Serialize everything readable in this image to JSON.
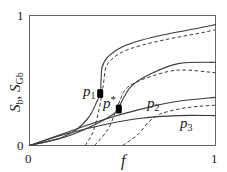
{
  "chart_data": {
    "type": "line",
    "title": "",
    "xlabel": "f",
    "ylabel": "S_b, S_Gb",
    "xlim": [
      0,
      1
    ],
    "ylim": [
      0,
      1
    ],
    "x_ticks": [
      "0",
      "1"
    ],
    "y_ticks": [
      "0",
      "1"
    ],
    "grid": false,
    "legend": "inline curve labels",
    "series": [
      {
        "name": "p1 (S_b, solid)",
        "label": "p1",
        "style": "solid",
        "x": [
          0,
          0.15,
          0.25,
          0.32,
          0.36,
          0.38,
          0.385,
          0.39,
          0.42,
          0.5,
          0.6,
          0.75,
          0.9,
          1.0
        ],
        "y": [
          0,
          0.05,
          0.12,
          0.22,
          0.33,
          0.4,
          0.5,
          0.6,
          0.68,
          0.76,
          0.81,
          0.86,
          0.9,
          0.93
        ]
      },
      {
        "name": "p1 (S_Gb, dashed)",
        "label": "p1",
        "style": "dashed",
        "x": [
          0.3,
          0.34,
          0.37,
          0.39,
          0.4,
          0.41,
          0.44,
          0.5,
          0.6,
          0.75,
          0.9,
          1.0
        ],
        "y": [
          0,
          0.1,
          0.25,
          0.4,
          0.5,
          0.6,
          0.66,
          0.72,
          0.77,
          0.82,
          0.86,
          0.89
        ]
      },
      {
        "name": "p* (S_b, solid)",
        "label": "p*",
        "style": "solid",
        "x": [
          0,
          0.2,
          0.35,
          0.45,
          0.48,
          0.5,
          0.55,
          0.65,
          0.8,
          1.0
        ],
        "y": [
          0,
          0.07,
          0.16,
          0.24,
          0.29,
          0.35,
          0.46,
          0.55,
          0.63,
          0.64
        ]
      },
      {
        "name": "p* (S_Gb, dashed)",
        "label": "p*",
        "style": "dashed",
        "x": [
          0.35,
          0.42,
          0.46,
          0.49,
          0.51,
          0.55,
          0.65,
          0.8,
          1.0
        ],
        "y": [
          0,
          0.12,
          0.25,
          0.36,
          0.42,
          0.47,
          0.53,
          0.58,
          0.56
        ]
      },
      {
        "name": "p2 (S_b, solid)",
        "label": "p2",
        "style": "solid",
        "x": [
          0,
          0.2,
          0.4,
          0.6,
          0.8,
          1.0
        ],
        "y": [
          0,
          0.1,
          0.2,
          0.28,
          0.34,
          0.37
        ]
      },
      {
        "name": "p2 (S_Gb, dashed)",
        "label": "p2",
        "style": "dashed",
        "x": [
          0.5,
          0.58,
          0.64,
          0.7,
          0.8,
          0.9,
          1.0
        ],
        "y": [
          0,
          0.08,
          0.18,
          0.24,
          0.28,
          0.3,
          0.31
        ]
      },
      {
        "name": "p3 (S_b, solid)",
        "label": "p3",
        "style": "solid",
        "x": [
          0,
          0.2,
          0.4,
          0.6,
          0.8,
          1.0
        ],
        "y": [
          0,
          0.09,
          0.16,
          0.21,
          0.23,
          0.23
        ]
      }
    ],
    "markers": [
      {
        "label": "p1",
        "x": 0.38,
        "y": 0.4,
        "shape": "filled-rect"
      },
      {
        "label": "p*",
        "x": 0.48,
        "y": 0.28,
        "shape": "filled-rect"
      }
    ],
    "annotations": [
      {
        "text": "p1",
        "x": 0.3,
        "y": 0.4
      },
      {
        "text": "p*",
        "x": 0.4,
        "y": 0.32
      },
      {
        "text": "p2",
        "x": 0.62,
        "y": 0.32
      },
      {
        "text": "p3",
        "x": 0.74,
        "y": 0.12
      }
    ]
  },
  "labels": {
    "y_axis_main": "S",
    "y_axis_sub1": "b",
    "y_axis_sep": ", ",
    "y_axis_main2": "S",
    "y_axis_sub2": "Gb",
    "x_axis": "f",
    "x_tick_0": "0",
    "x_tick_1": "1",
    "y_tick_0": "0",
    "y_tick_1": "1",
    "curve_p1": "p",
    "curve_p1_sub": "1",
    "curve_pstar": "p",
    "curve_pstar_sup": "*",
    "curve_p2": "p",
    "curve_p2_sub": "2",
    "curve_p3": "p",
    "curve_p3_sub": "3"
  },
  "colors": {
    "line": "#3a3a3a",
    "frame": "#555555",
    "marker": "#000000"
  }
}
